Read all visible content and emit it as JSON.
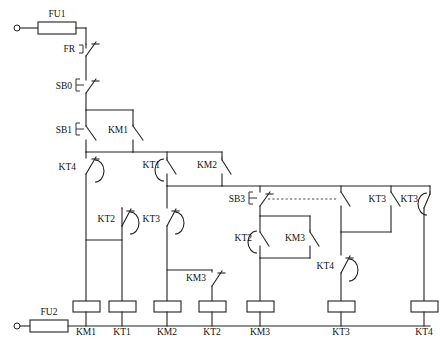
{
  "diagram": {
    "type": "electrical-ladder-schematic",
    "colors": {
      "wire": "#222222",
      "background": "#ffffff",
      "label": "#111111"
    },
    "supply": {
      "top_fuse": "FU1",
      "bottom_fuse": "FU2"
    },
    "top_branch": [
      {
        "name": "FR",
        "kind": "thermal-overload-nc"
      },
      {
        "name": "SB0",
        "kind": "pushbutton-nc"
      }
    ],
    "rung_labels": {
      "sb1": "SB1",
      "km1_seal": "KM1",
      "kt4_nc": "KT4",
      "kt1_no_delay": "KT1",
      "km2_seal": "KM2",
      "kt2_nc": "KT2",
      "kt3_nc": "KT3",
      "km3_nc": "KM3",
      "sb3": "SB3",
      "kt2_no_delay": "KT2",
      "km3_seal": "KM3",
      "kt3_no": "KT3",
      "kt3_no_delay": "KT3",
      "kt4_nc2": "KT4"
    },
    "coils": [
      {
        "label": "KM1"
      },
      {
        "label": "KT1"
      },
      {
        "label": "KM2"
      },
      {
        "label": "KT2"
      },
      {
        "label": "KM3"
      },
      {
        "label": "KT3"
      },
      {
        "label": "KT4"
      }
    ]
  }
}
